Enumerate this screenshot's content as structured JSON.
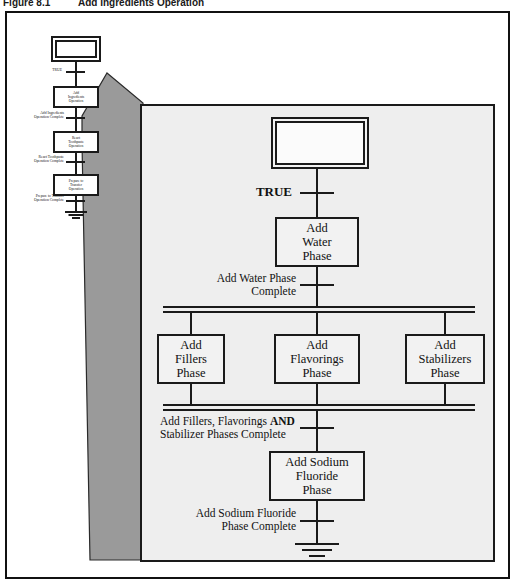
{
  "caption": {
    "figure_number": "Figure 8.1",
    "figure_title": "Add Ingredients Operation"
  },
  "colors": {
    "line": "#1a1a1a",
    "panel_fill": "#eeeeee",
    "wedge_fill": "#9a9a9a",
    "page_background": "#ffffff"
  },
  "mini_diagram": {
    "name": "toothpaste-manufacturing-operation-sequence",
    "start_state": {
      "label": "",
      "type": "double-box"
    },
    "transitions": [
      {
        "label": "TRUE"
      },
      {
        "label": "Add Ingredients\nOperation Complete"
      },
      {
        "label": "React Toothpaste\nOperation Complete"
      },
      {
        "label": "Prepare to Transfer\nOperation Complete"
      }
    ],
    "steps": [
      {
        "line1": "Add",
        "line2": "Ingredients",
        "line3": "Operation"
      },
      {
        "line1": "React",
        "line2": "Toothpaste",
        "line3": "Operation"
      },
      {
        "line1": "Prepare to",
        "line2": "Transfer",
        "line3": "Operation"
      }
    ],
    "terminator": "ground"
  },
  "panel_diagram": {
    "name": "add-ingredients-operation-detail",
    "start_state": {
      "label": "",
      "type": "double-box"
    },
    "initial_transition": "TRUE",
    "steps": [
      {
        "id": "add-water-phase",
        "line1": "Add",
        "line2": "Water",
        "line3": "Phase"
      },
      {
        "id": "add-fillers-phase",
        "line1": "Add",
        "line2": "Fillers",
        "line3": "Phase"
      },
      {
        "id": "add-flavorings-phase",
        "line1": "Add",
        "line2": "Flavorings",
        "line3": "Phase"
      },
      {
        "id": "add-stabilizers-phase",
        "line1": "Add",
        "line2": "Stabilizers",
        "line3": "Phase"
      },
      {
        "id": "add-sodium-fluoride-phase",
        "line1": "Add Sodium",
        "line2": "Fluoride",
        "line3": "Phase"
      }
    ],
    "transitions": [
      {
        "id": "add-water-complete",
        "line1": "Add Water Phase",
        "line2": "Complete"
      },
      {
        "id": "parallel-complete",
        "line1a": "Add Fillers, Flavorings ",
        "line1b": "AND",
        "line2": "Stabilizer Phases Complete"
      },
      {
        "id": "sodium-fluoride-complete",
        "line1": "Add Sodium Fluoride",
        "line2": "Phase Complete"
      }
    ],
    "fork_bar": "double-horizontal-bar",
    "join_bar": "double-horizontal-bar",
    "terminator": "ground"
  }
}
